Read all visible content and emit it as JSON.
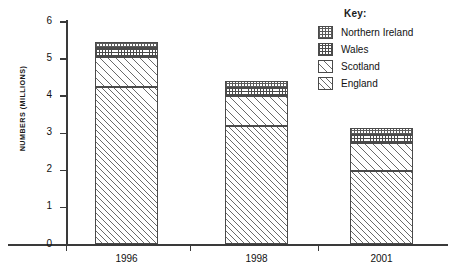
{
  "chart_data": {
    "type": "bar",
    "subtype": "stacked-bar",
    "title": "",
    "xlabel": "",
    "ylabel": "NUMBERS (MILLIONS)",
    "categories": [
      "1996",
      "1998",
      "2001"
    ],
    "ylim": [
      0,
      6
    ],
    "yticks": [
      0,
      1,
      2,
      3,
      4,
      5,
      6
    ],
    "ytick_labels": [
      "0",
      "1",
      "2",
      "3",
      "4",
      "5",
      "6"
    ],
    "grid": false,
    "legend_position": "top-right",
    "legend_title": "Key:",
    "series": [
      {
        "name": "England",
        "values": [
          4.25,
          3.2,
          1.97
        ],
        "pattern": "diagonal-hatch"
      },
      {
        "name": "Scotland",
        "values": [
          0.8,
          0.8,
          0.78
        ],
        "pattern": "diagonal-hatch-wide"
      },
      {
        "name": "Wales",
        "values": [
          0.25,
          0.22,
          0.2
        ],
        "pattern": "dotted-grid"
      },
      {
        "name": "Northern Ireland",
        "values": [
          0.17,
          0.18,
          0.2
        ],
        "pattern": "grid"
      }
    ],
    "stack_order_bottom_to_top": [
      "England",
      "Scotland",
      "Wales",
      "Northern Ireland"
    ],
    "totals": [
      5.47,
      4.4,
      3.15
    ]
  },
  "legend": {
    "title": "Key:",
    "items": [
      {
        "label": "Northern Ireland"
      },
      {
        "label": "Wales"
      },
      {
        "label": "Scotland"
      },
      {
        "label": "England"
      }
    ]
  },
  "axes": {
    "y_title": "NUMBERS (MILLIONS)",
    "y_labels": [
      "6",
      "5",
      "4",
      "3",
      "2",
      "1",
      "0"
    ],
    "x_labels": [
      "1996",
      "1998",
      "2001"
    ]
  }
}
